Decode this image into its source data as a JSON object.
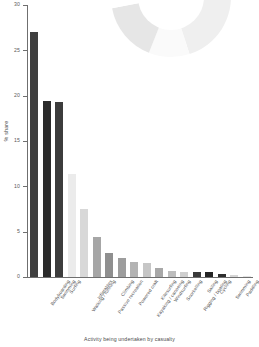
{
  "chart_data": {
    "type": "bar",
    "title": "",
    "subtitle": "",
    "xlabel": "Activity being undertaken by casualty",
    "ylabel": "% share",
    "ylim": [
      0,
      30
    ],
    "yticks": [
      0,
      5,
      10,
      15,
      20,
      25,
      30
    ],
    "ytick_labels": [
      "0",
      "5",
      "10",
      "15",
      "20",
      "25",
      "30"
    ],
    "grid": false,
    "legend": "none",
    "categories": [
      "Bodyboarding",
      "Swimming",
      "Surfing",
      "Walking / running",
      "Inflatables",
      "Passive recreation",
      "Climbing",
      "Powered craft",
      "Kayaking / canoeing",
      "Kitesurfing",
      "Windsurfing",
      "Snorkelling",
      "Rigging / boating",
      "Sailing",
      "Cycling",
      "Swimming",
      "Paddling",
      "Snowkiting"
    ],
    "values": [
      27.0,
      19.4,
      19.3,
      11.4,
      7.5,
      4.4,
      2.7,
      2.1,
      1.7,
      1.6,
      1.0,
      0.7,
      0.6,
      0.6,
      0.5,
      0.3,
      0.2,
      0.1
    ],
    "bar_colors": [
      "#3f3f3f",
      "#2b2b2b",
      "#3c3c3c",
      "#ebebeb",
      "#d8d8d8",
      "#a6a6a6",
      "#8f8f8f",
      "#9d9d9d",
      "#b3b3b3",
      "#c6c6c6",
      "#a8a8a8",
      "#bdbdbd",
      "#cfcfcf",
      "#3a3a3a",
      "#242424",
      "#2e2e2e",
      "#d6d6d6",
      "#e2e2e2"
    ],
    "axis_color": "#6f6f6f"
  },
  "donut": {
    "type": "pie",
    "label": "activity-share-donut",
    "segments": [
      {
        "name": "segment-1",
        "value": 14,
        "color": "#3a3a3a"
      },
      {
        "name": "segment-2",
        "value": 9,
        "color": "#ffffff"
      },
      {
        "name": "segment-3",
        "value": 22,
        "color": "#efefef"
      },
      {
        "name": "segment-4",
        "value": 11,
        "color": "#fafafa"
      },
      {
        "name": "segment-5",
        "value": 16,
        "color": "#e6e6e6"
      },
      {
        "name": "segment-6",
        "value": 10,
        "color": "#ffffff"
      },
      {
        "name": "segment-7",
        "value": 18,
        "color": "#343434"
      }
    ]
  }
}
